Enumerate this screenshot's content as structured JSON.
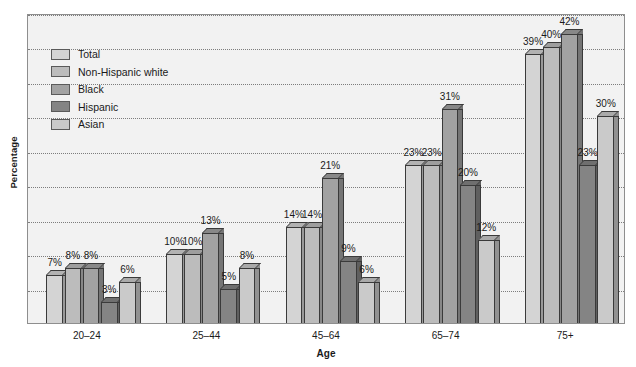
{
  "chart_data": {
    "type": "bar",
    "title": "",
    "xlabel": "Age",
    "ylabel": "Percentage",
    "categories": [
      "20–24",
      "25–44",
      "45–64",
      "65–74",
      "75+"
    ],
    "series": [
      {
        "name": "Total",
        "values": [
          7,
          10,
          14,
          23,
          39
        ],
        "color": "#d4d4d4"
      },
      {
        "name": "Non-Hispanic white",
        "values": [
          8,
          10,
          14,
          23,
          40
        ],
        "color": "#bcbcbc"
      },
      {
        "name": "Black",
        "values": [
          8,
          13,
          21,
          31,
          42
        ],
        "color": "#a2a2a2"
      },
      {
        "name": "Hispanic",
        "values": [
          3,
          5,
          9,
          20,
          23
        ],
        "color": "#848484"
      },
      {
        "name": "Asian",
        "values": [
          6,
          8,
          6,
          12,
          30
        ],
        "color": "#cacaca"
      }
    ],
    "value_suffix": "%",
    "ylim": [
      0,
      45
    ],
    "y_gridline_step": 5,
    "grid": true,
    "y_tick_labels_shown": false,
    "legend_position": "top-left-inside",
    "data_labels_shown": true
  },
  "legend": {
    "items": [
      {
        "label": "Total"
      },
      {
        "label": "Non-Hispanic white"
      },
      {
        "label": "Black"
      },
      {
        "label": "Hispanic"
      },
      {
        "label": "Asian"
      }
    ]
  },
  "axes": {
    "y_title": "Percentage",
    "x_title": "Age"
  }
}
